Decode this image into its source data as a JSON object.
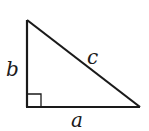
{
  "diagram": {
    "type": "right-triangle",
    "stroke_color": "#1a1a1a",
    "labels": {
      "leg_vertical": "b",
      "leg_horizontal": "a",
      "hypotenuse": "c"
    },
    "right_angle_marker": true
  }
}
